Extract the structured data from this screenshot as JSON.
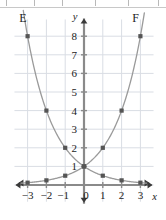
{
  "figure": {
    "background": "#ffffff",
    "grid_color": "#d9dde4",
    "axis_color": "#8a8a8a",
    "curve_color": "#9a9a9a",
    "marker_color": "#555555",
    "text_color": "#222222"
  },
  "labels": {
    "x_axis": "x",
    "y_axis": "y",
    "curve_e": "E",
    "curve_f": "F"
  },
  "chart_data": {
    "type": "line",
    "title": "",
    "xlabel": "x",
    "ylabel": "y",
    "xlim": [
      -3.7,
      3.7
    ],
    "ylim": [
      -0.9,
      8.9
    ],
    "grid": true,
    "legend": "none",
    "x_ticks": [
      -3,
      -2,
      -1,
      0,
      1,
      2,
      3
    ],
    "x_tick_labels": [
      "-3",
      "-2",
      "-1",
      "0",
      "1",
      "2",
      "3"
    ],
    "y_ticks": [
      1,
      2,
      3,
      4,
      5,
      6,
      7,
      8
    ],
    "y_tick_labels": [
      "1",
      "2",
      "3",
      "4",
      "5",
      "6",
      "7",
      "8"
    ],
    "annotations": [
      {
        "text": "E",
        "x": -3.25,
        "y": 8.75
      },
      {
        "text": "F",
        "x": 2.75,
        "y": 8.75
      }
    ],
    "series": [
      {
        "name": "E",
        "label": "E",
        "equation": "y = 2^(-x)",
        "x": [
          -3,
          -2,
          -1,
          0,
          1,
          2,
          3
        ],
        "values": [
          8,
          4,
          2,
          1,
          0.5,
          0.25,
          0.125
        ],
        "markers": [
          {
            "x": -3,
            "y": 8
          },
          {
            "x": -2,
            "y": 4
          },
          {
            "x": -1,
            "y": 2
          },
          {
            "x": 0,
            "y": 1
          },
          {
            "x": 1,
            "y": 0.5
          },
          {
            "x": 2,
            "y": 0.25
          },
          {
            "x": 3,
            "y": 0.125
          }
        ]
      },
      {
        "name": "F",
        "label": "F",
        "equation": "y = 2^x",
        "x": [
          -3,
          -2,
          -1,
          0,
          1,
          2,
          3
        ],
        "values": [
          0.125,
          0.25,
          0.5,
          1,
          2,
          4,
          8
        ],
        "markers": [
          {
            "x": -3,
            "y": 0.125
          },
          {
            "x": -2,
            "y": 0.25
          },
          {
            "x": -1,
            "y": 0.5
          },
          {
            "x": 0,
            "y": 1
          },
          {
            "x": 1,
            "y": 2
          },
          {
            "x": 2,
            "y": 4
          },
          {
            "x": 3,
            "y": 8
          }
        ]
      }
    ]
  }
}
